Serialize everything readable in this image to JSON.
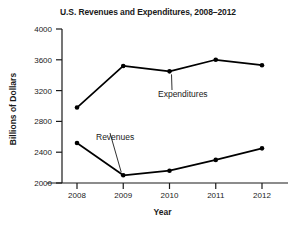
{
  "chart_data": {
    "type": "line",
    "title": "U.S. Revenues and Expenditures, 2008–2012",
    "xlabel": "Year",
    "ylabel": "Billions of Dollars",
    "categories": [
      "2008",
      "2009",
      "2010",
      "2011",
      "2012"
    ],
    "x": [
      2008,
      2009,
      2010,
      2011,
      2012
    ],
    "series": [
      {
        "name": "Expenditures",
        "values": [
          2980,
          3520,
          3450,
          3600,
          3530
        ],
        "color": "#000000",
        "marker": "circle"
      },
      {
        "name": "Revenues",
        "values": [
          2520,
          2100,
          2160,
          2300,
          2450
        ],
        "color": "#000000",
        "marker": "circle"
      }
    ],
    "ylim": [
      2000,
      4000
    ],
    "yticks": [
      2000,
      2400,
      2800,
      3200,
      3600,
      4000
    ],
    "ytick_labels": [
      "2000",
      "2400",
      "2800",
      "3200",
      "3600",
      "4000"
    ],
    "xtick_labels": [
      "2008",
      "2009",
      "2010",
      "2011",
      "2012"
    ],
    "grid": false,
    "legend": "annotations-inline",
    "annotations": [
      {
        "text": "Expenditures",
        "points_to_series": "Expenditures",
        "points_to_x": "2010"
      },
      {
        "text": "Revenues",
        "points_to_series": "Revenues",
        "points_to_x": "2009"
      }
    ]
  }
}
